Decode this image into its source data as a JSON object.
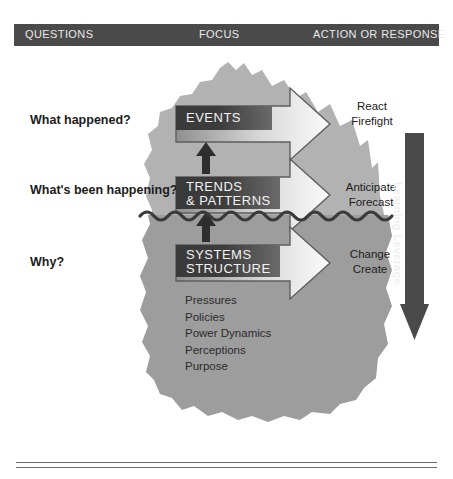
{
  "header": {
    "columns": [
      {
        "label": "QUESTIONS"
      },
      {
        "label": "FOCUS"
      },
      {
        "label": "ACTION OR RESPONSE"
      }
    ]
  },
  "questions": [
    {
      "label": "What happened?"
    },
    {
      "label": "What's been happening?"
    },
    {
      "label": "Why?"
    }
  ],
  "tiers": [
    {
      "focus_line1": "EVENTS",
      "focus_line2": "",
      "action_line1": "React",
      "action_line2": "Firefight"
    },
    {
      "focus_line1": "TRENDS",
      "focus_line2": "& PATTERNS",
      "action_line1": "Anticipate",
      "action_line2": "Forecast"
    },
    {
      "focus_line1": "SYSTEMS",
      "focus_line2": "STRUCTURE",
      "action_line1": "Change",
      "action_line2": "Create"
    }
  ],
  "deep_structure": {
    "items": [
      "Pressures",
      "Policies",
      "Power Dynamics",
      "Perceptions",
      "Purpose"
    ]
  },
  "leverage": {
    "label": "Learning Leverage"
  },
  "colors": {
    "header_bar": "#4a4a4a",
    "iceberg_above": "#b0b0b0",
    "iceberg_below": "#9a9a9a",
    "label_box_dark": "#3a3a3a",
    "waterline": "#3d3d3d",
    "arrow_fill": "#e8e8e8",
    "text_dark": "#1c1c1c",
    "text_light": "#f2f2f2"
  }
}
